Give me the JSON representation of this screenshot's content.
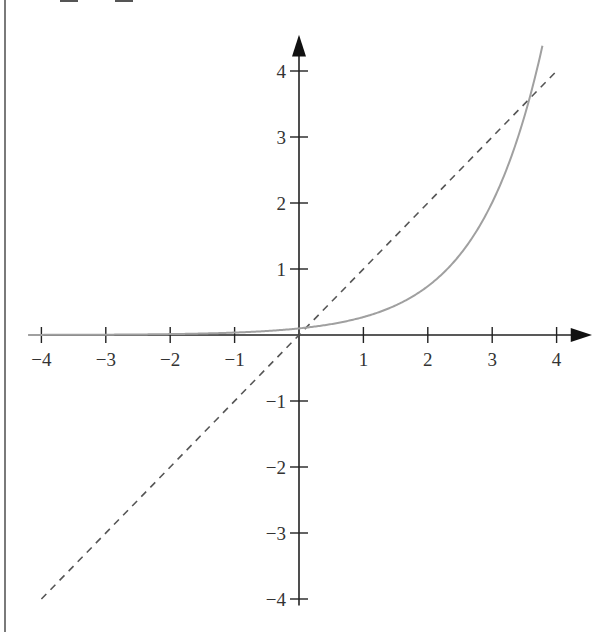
{
  "chart_data": {
    "type": "line",
    "title": "",
    "xlabel": "",
    "ylabel": "",
    "xlim": [
      -4,
      4
    ],
    "ylim": [
      -4,
      4
    ],
    "grid": false,
    "x_ticks": [
      -4,
      -3,
      -2,
      -1,
      1,
      2,
      3,
      4
    ],
    "y_ticks": [
      4,
      3,
      2,
      1,
      -1,
      -2,
      -3,
      -4
    ],
    "x_tick_labels": [
      "−4",
      "−3",
      "−2",
      "−1",
      "1",
      "2",
      "3",
      "4"
    ],
    "y_tick_labels": [
      "4",
      "3",
      "2",
      "1",
      "−1",
      "−2",
      "−3",
      "−4"
    ],
    "series": [
      {
        "name": "exponential curve (y ≈ 0.1·e^x)",
        "style": "solid",
        "color": "#a0a0a0",
        "x": [
          -4,
          -3,
          -2,
          -1,
          0,
          1,
          2,
          3,
          3.5,
          3.8
        ],
        "y": [
          0.002,
          0.005,
          0.014,
          0.037,
          0.1,
          0.27,
          0.74,
          2.0,
          3.3,
          4.47
        ]
      },
      {
        "name": "identity line (y = x)",
        "style": "dashed",
        "color": "#555555",
        "x": [
          -4,
          4
        ],
        "y": [
          -4,
          4
        ]
      }
    ],
    "legend": null
  },
  "axes": {
    "origin_px": [
      299,
      335
    ],
    "x_unit_px": 64.4,
    "y_unit_px": 66.0,
    "axis_color": "#222222"
  }
}
